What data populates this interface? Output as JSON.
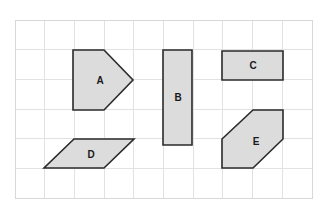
{
  "figure": {
    "background_color": "#ffffff",
    "grid": {
      "name": "coordinate-grid",
      "x_start": 15,
      "y_start": 20,
      "x_end": 312,
      "y_end": 198,
      "cell_size": 29.7,
      "columns": 10,
      "rows": 6,
      "line_color": "#e2e2e2",
      "border_color": "#d8d8d8",
      "line_width": 1
    },
    "style": {
      "shape_fill": "#dcdcdc",
      "shape_stroke": "#2a2a2a",
      "shape_stroke_width": 1.6,
      "label_color": "#1a1a1a",
      "label_font_size": 10
    },
    "shapes": [
      {
        "id": "A",
        "label": "A",
        "type": "pentagon",
        "description": "arrow-like pentagon pointing right",
        "points": "73,50 104,50 133,80 104,110 73,110",
        "label_x": 100,
        "label_y": 81
      },
      {
        "id": "B",
        "label": "B",
        "type": "rectangle",
        "description": "tall vertical rectangle",
        "points": "163,50 192,50 192,145 163,145",
        "label_x": 178,
        "label_y": 98
      },
      {
        "id": "C",
        "label": "C",
        "type": "rectangle",
        "description": "wide horizontal rectangle",
        "points": "222,51 283,51 283,80 222,80",
        "label_x": 253,
        "label_y": 66
      },
      {
        "id": "D",
        "label": "D",
        "type": "parallelogram",
        "description": "slanted parallelogram",
        "points": "74,139 134,139 104,168 44,168",
        "label_x": 91,
        "label_y": 155
      },
      {
        "id": "E",
        "label": "E",
        "type": "hexagon",
        "description": "hexagon with two cut corners",
        "points": "222,139 253,110 283,110 283,139 253,168 222,168",
        "label_x": 256,
        "label_y": 142
      }
    ]
  }
}
